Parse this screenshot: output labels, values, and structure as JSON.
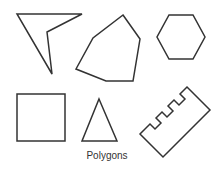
{
  "caption": "Polygons",
  "colors": {
    "stroke": "#333333",
    "background": "#ffffff"
  },
  "shapes": [
    {
      "name": "concave-quadrilateral",
      "points": "17,14 82,14 47,32 52,74"
    },
    {
      "name": "hexagon-irregular",
      "points": "123,15 140,39 133,81 106,81 76,69 93,38"
    },
    {
      "name": "regular-hexagon",
      "points": "169,15 193,15 205,37 193,59 169,59 157,37"
    },
    {
      "name": "square",
      "points": "17,94 65,94 65,141 17,141"
    },
    {
      "name": "triangle",
      "points": "99,99 117,141 82,141"
    },
    {
      "name": "comb-polygon",
      "points": "187,87 210,110 163,157 140,134 150,124 155,129 161,123 156,118 162,112 167,117 173,111 168,106 174,100 179,105 185,99 180,94"
    }
  ]
}
